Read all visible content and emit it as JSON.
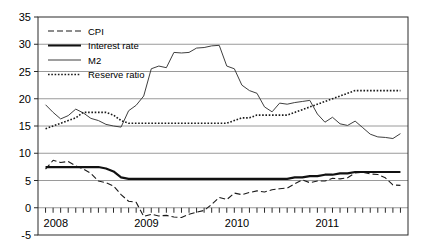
{
  "chart_data": {
    "type": "line",
    "title": "",
    "xlabel": "",
    "ylabel": "",
    "ylim": [
      -5,
      35
    ],
    "yticks": [
      -5,
      0,
      5,
      10,
      15,
      20,
      25,
      30,
      35
    ],
    "xlim": [
      "2007-12",
      "2011-12"
    ],
    "xticks_labeled": [
      "2008",
      "2009",
      "2010",
      "2011"
    ],
    "x_tick_interval": "monthly",
    "grid": "horizontal",
    "legend_position": "top-left",
    "legend": [
      "CPI",
      "Interest rate",
      "M2",
      "Reserve ratio"
    ],
    "x": [
      "2008-01",
      "2008-02",
      "2008-03",
      "2008-04",
      "2008-05",
      "2008-06",
      "2008-07",
      "2008-08",
      "2008-09",
      "2008-10",
      "2008-11",
      "2008-12",
      "2009-01",
      "2009-02",
      "2009-03",
      "2009-04",
      "2009-05",
      "2009-06",
      "2009-07",
      "2009-08",
      "2009-09",
      "2009-10",
      "2009-11",
      "2009-12",
      "2010-01",
      "2010-02",
      "2010-03",
      "2010-04",
      "2010-05",
      "2010-06",
      "2010-07",
      "2010-08",
      "2010-09",
      "2010-10",
      "2010-11",
      "2010-12",
      "2011-01",
      "2011-02",
      "2011-03",
      "2011-04",
      "2011-05",
      "2011-06",
      "2011-07",
      "2011-08",
      "2011-09",
      "2011-10",
      "2011-11",
      "2011-12"
    ],
    "series": [
      {
        "name": "CPI",
        "style": "dashed",
        "color": "#1a1a1a",
        "width": 1.1,
        "values": [
          7.1,
          8.7,
          8.3,
          8.5,
          7.7,
          7.1,
          6.3,
          4.9,
          4.6,
          4.0,
          2.4,
          1.2,
          1.0,
          -1.6,
          -1.2,
          -1.5,
          -1.4,
          -1.7,
          -1.8,
          -1.2,
          -0.8,
          -0.5,
          0.6,
          1.9,
          1.5,
          2.7,
          2.4,
          2.8,
          3.1,
          2.9,
          3.3,
          3.5,
          3.6,
          4.4,
          5.1,
          4.6,
          4.9,
          4.9,
          5.4,
          5.3,
          5.5,
          6.4,
          6.5,
          6.2,
          6.1,
          5.5,
          4.2,
          4.1
        ]
      },
      {
        "name": "Interest rate",
        "style": "solid-thick",
        "color": "#111111",
        "width": 2.2,
        "values": [
          7.47,
          7.47,
          7.47,
          7.47,
          7.47,
          7.47,
          7.47,
          7.47,
          7.2,
          6.66,
          5.58,
          5.31,
          5.31,
          5.31,
          5.31,
          5.31,
          5.31,
          5.31,
          5.31,
          5.31,
          5.31,
          5.31,
          5.31,
          5.31,
          5.31,
          5.31,
          5.31,
          5.31,
          5.31,
          5.31,
          5.31,
          5.31,
          5.31,
          5.56,
          5.56,
          5.81,
          5.81,
          6.06,
          6.06,
          6.31,
          6.31,
          6.56,
          6.56,
          6.56,
          6.56,
          6.56,
          6.56,
          6.56
        ]
      },
      {
        "name": "M2",
        "style": "solid-thin",
        "color": "#3f3f3f",
        "width": 1.0,
        "values": [
          18.9,
          17.5,
          16.3,
          16.9,
          18.1,
          17.4,
          16.4,
          16.0,
          15.3,
          15.0,
          14.8,
          17.8,
          18.8,
          20.5,
          25.5,
          26.0,
          25.7,
          28.5,
          28.4,
          28.5,
          29.3,
          29.4,
          29.7,
          29.8,
          26.0,
          25.5,
          22.5,
          21.5,
          21.0,
          18.5,
          17.6,
          19.2,
          19.0,
          19.3,
          19.5,
          19.7,
          17.2,
          15.7,
          16.6,
          15.4,
          15.1,
          15.9,
          14.7,
          13.5,
          13.0,
          12.9,
          12.7,
          13.6
        ]
      },
      {
        "name": "Reserve ratio",
        "style": "dotted",
        "color": "#1a1a1a",
        "width": 1.6,
        "values": [
          14.5,
          15.0,
          15.5,
          16.0,
          16.5,
          17.5,
          17.5,
          17.5,
          17.5,
          17.0,
          16.0,
          15.5,
          15.5,
          15.5,
          15.5,
          15.5,
          15.5,
          15.5,
          15.5,
          15.5,
          15.5,
          15.5,
          15.5,
          15.5,
          15.5,
          16.0,
          16.5,
          16.5,
          17.0,
          17.0,
          17.0,
          17.0,
          17.0,
          17.5,
          18.0,
          18.5,
          19.0,
          19.5,
          20.0,
          20.5,
          21.0,
          21.5,
          21.5,
          21.5,
          21.5,
          21.5,
          21.5,
          21.5
        ]
      }
    ]
  }
}
